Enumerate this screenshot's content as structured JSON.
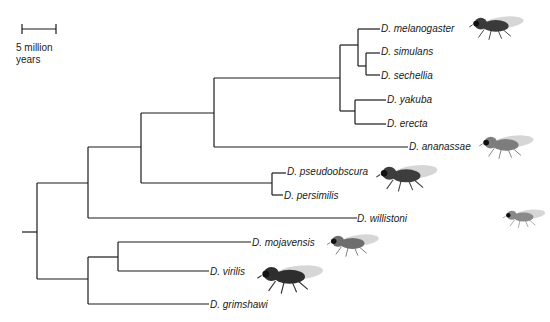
{
  "scale_bar": {
    "line1": "5 million",
    "line2": "years"
  },
  "species": [
    {
      "name": "D. melanogaster",
      "x": 381,
      "y": 23
    },
    {
      "name": "D. simulans",
      "x": 381,
      "y": 46
    },
    {
      "name": "D. sechellia",
      "x": 381,
      "y": 70
    },
    {
      "name": "D. yakuba",
      "x": 387,
      "y": 94
    },
    {
      "name": "D. erecta",
      "x": 387,
      "y": 118
    },
    {
      "name": "D. ananassae",
      "x": 409,
      "y": 141
    },
    {
      "name": "D. pseudoobscura",
      "x": 287,
      "y": 166
    },
    {
      "name": "D. persimilis",
      "x": 284,
      "y": 190
    },
    {
      "name": "D. willistoni",
      "x": 357,
      "y": 213
    },
    {
      "name": "D. mojavensis",
      "x": 252,
      "y": 237
    },
    {
      "name": "D. virilis",
      "x": 210,
      "y": 266
    },
    {
      "name": "D. grimshawi",
      "x": 210,
      "y": 299
    }
  ],
  "flies": [
    {
      "name": "melanogaster-fly",
      "x": 468,
      "y": 12,
      "w": 58,
      "tone": "#3a3a3a"
    },
    {
      "name": "ananassae-fly",
      "x": 478,
      "y": 131,
      "w": 58,
      "tone": "#7d7d7d"
    },
    {
      "name": "pseudoobscura-fly",
      "x": 375,
      "y": 160,
      "w": 65,
      "tone": "#3d3d3d"
    },
    {
      "name": "willistoni-fly",
      "x": 502,
      "y": 206,
      "w": 45,
      "tone": "#8a8a8a"
    },
    {
      "name": "mojavensis-fly",
      "x": 326,
      "y": 230,
      "w": 55,
      "tone": "#6e6e6e"
    },
    {
      "name": "virilis-fly",
      "x": 256,
      "y": 260,
      "w": 70,
      "tone": "#2e2e2e"
    }
  ]
}
